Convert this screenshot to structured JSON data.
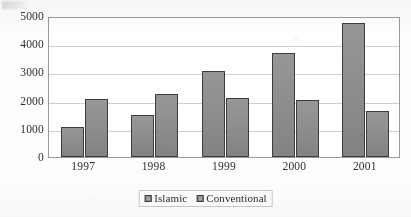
{
  "chart_data": {
    "type": "bar",
    "title": "",
    "subtitle": "",
    "xlabel": "",
    "ylabel": "",
    "categories": [
      "1997",
      "1998",
      "1999",
      "2000",
      "2001"
    ],
    "series": [
      {
        "name": "Islamic",
        "values": [
          1050,
          1500,
          3050,
          3700,
          4750
        ]
      },
      {
        "name": "Conventional",
        "values": [
          2070,
          2250,
          2100,
          2020,
          1620
        ]
      }
    ],
    "ylim": [
      0,
      5000
    ],
    "ytick_values": [
      0,
      1000,
      2000,
      3000,
      4000,
      5000
    ],
    "ytick_labels": [
      "0",
      "1000",
      "2000",
      "3000",
      "4000",
      "5000"
    ],
    "grid": true,
    "grid_axis": "y",
    "legend_position": "bottom",
    "bar_fill_color": "#8b8b8b",
    "bar_border_color": "#3d3d3d",
    "plot_border_color": "#9a9a9a",
    "gridline_color": "#cfcfcf",
    "background_color": "#fdfdfb"
  },
  "legend": {
    "entries": [
      {
        "label": "Islamic",
        "swatch_name": "legend-swatch-islamic"
      },
      {
        "label": "Conventional",
        "swatch_name": "legend-swatch-conventional"
      }
    ]
  }
}
